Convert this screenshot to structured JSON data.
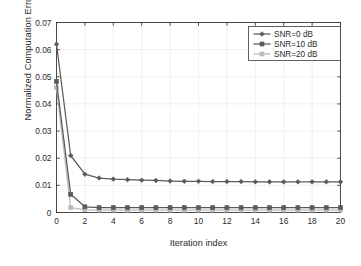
{
  "chart_data": {
    "type": "line",
    "title": "",
    "xlabel": "Iteration index",
    "ylabel": "Normalized Computation Error",
    "xlim": [
      0,
      20
    ],
    "ylim": [
      0,
      0.07
    ],
    "grid": true,
    "legend_position": "top-right",
    "xticks": [
      "0",
      "2",
      "4",
      "6",
      "8",
      "10",
      "12",
      "14",
      "16",
      "18",
      "20"
    ],
    "xtick_values": [
      0,
      2,
      4,
      6,
      8,
      10,
      12,
      14,
      16,
      18,
      20
    ],
    "yticks": [
      "0",
      "0.01",
      "0.02",
      "0.03",
      "0.04",
      "0.05",
      "0.06",
      "0.07"
    ],
    "ytick_values": [
      0,
      0.01,
      0.02,
      0.03,
      0.04,
      0.05,
      0.06,
      0.07
    ],
    "x": [
      0,
      1,
      2,
      3,
      4,
      5,
      6,
      7,
      8,
      9,
      10,
      11,
      12,
      13,
      14,
      15,
      16,
      17,
      18,
      19,
      20
    ],
    "series": [
      {
        "name": "SNR=0 dB",
        "marker": "diamond",
        "color": "#5a5a5a",
        "values": [
          0.062,
          0.021,
          0.0141,
          0.0127,
          0.0123,
          0.0121,
          0.0119,
          0.0118,
          0.0116,
          0.0115,
          0.0115,
          0.0114,
          0.0114,
          0.0114,
          0.0113,
          0.0113,
          0.0113,
          0.0113,
          0.0113,
          0.0113,
          0.0113
        ]
      },
      {
        "name": "SNR=10 dB",
        "marker": "square",
        "color": "#5a5a5a",
        "values": [
          0.0483,
          0.0067,
          0.0021,
          0.0018,
          0.0018,
          0.0018,
          0.0018,
          0.0018,
          0.0018,
          0.0018,
          0.0018,
          0.0018,
          0.0018,
          0.0018,
          0.0018,
          0.0018,
          0.0018,
          0.0018,
          0.0018,
          0.0018,
          0.0018
        ]
      },
      {
        "name": "SNR=20 dB",
        "marker": "square",
        "color": "#b9b9b9",
        "values": [
          0.046,
          0.0018,
          0.001,
          0.0009,
          0.0009,
          0.0009,
          0.0009,
          0.0009,
          0.0009,
          0.0009,
          0.0009,
          0.0009,
          0.0009,
          0.0009,
          0.0009,
          0.0009,
          0.0009,
          0.0009,
          0.0009,
          0.0009,
          0.0009
        ]
      }
    ]
  },
  "legend": {
    "entries": [
      {
        "label": "SNR=0 dB"
      },
      {
        "label": "SNR=10 dB"
      },
      {
        "label": "SNR=20 dB"
      }
    ]
  },
  "axes": {
    "x_title": "Iteration index",
    "y_title": "Normalized Computation Error"
  },
  "colors": {
    "axis": "#3a3a3a",
    "grid": "#ececec",
    "series_dark": "#5a5a5a",
    "series_light": "#b9b9b9",
    "background": "#ffffff",
    "text": "#2b2b2b"
  }
}
